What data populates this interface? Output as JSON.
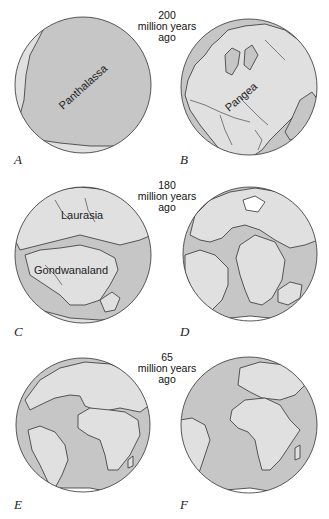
{
  "figure": {
    "colors": {
      "ocean": "#c6c6c6",
      "land": "#e0e0e0",
      "outline": "#333333",
      "ice": "#ffffff",
      "background": "#ffffff"
    },
    "eras": [
      {
        "value": "200",
        "unit": "million years",
        "suffix": "ago"
      },
      {
        "value": "180",
        "unit": "million years",
        "suffix": "ago"
      },
      {
        "value": "65",
        "unit": "million years",
        "suffix": "ago"
      }
    ],
    "panels": [
      {
        "letter": "A",
        "map_label": "Panthalassa"
      },
      {
        "letter": "B",
        "map_label": "Pangea"
      },
      {
        "letter": "C",
        "map_labels": [
          "Laurasia",
          "Gondwanaland"
        ]
      },
      {
        "letter": "D"
      },
      {
        "letter": "E"
      },
      {
        "letter": "F"
      }
    ]
  }
}
